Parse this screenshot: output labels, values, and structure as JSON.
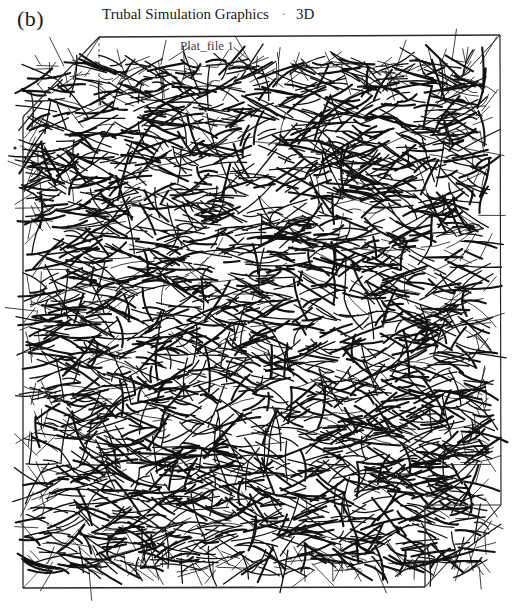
{
  "figure": {
    "panel_label": "(b)",
    "title": "Trubal Simulation Graphics",
    "title_separator": "·",
    "title_suffix": "3D",
    "subtitle": "Plat_file 1"
  },
  "scene": {
    "box_color": "#2a2a2a",
    "fiber_color": "#111111",
    "background": "#ffffff",
    "box": {
      "back_top_left": [
        99,
        37
      ],
      "back_top_right": [
        500,
        35
      ],
      "back_bottom_right": [
        501,
        505
      ],
      "front_top_left": [
        23,
        117
      ],
      "front_bottom_left": [
        23,
        588
      ],
      "front_bottom_right": [
        425,
        587
      ],
      "front_right_top_visible": [
        425,
        505
      ]
    },
    "fiber_region": {
      "x0": 30,
      "y0": 60,
      "x1": 485,
      "y1": 572
    },
    "fiber_count": 2600,
    "fiber_seed": 7,
    "stray_dot": [
      15,
      148
    ]
  }
}
